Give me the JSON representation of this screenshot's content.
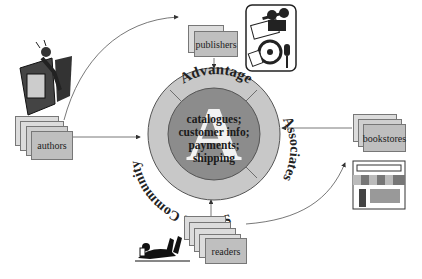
{
  "hub": {
    "outer_ring": {
      "top": "Advantage",
      "right": "Associates",
      "bottom_left": "Sales & Community"
    },
    "center_logo_letter": "A",
    "center_lines": [
      "catalogues;",
      "customer info;",
      "payments;",
      "shipping"
    ]
  },
  "nodes": {
    "publishers": {
      "label": "publishers",
      "icon": "film-projector-icon"
    },
    "authors": {
      "label": "authors",
      "icon": "writer-at-desk-icon"
    },
    "bookstores": {
      "label": "bookstores",
      "icon": "storefront-icon"
    },
    "readers": {
      "label": "readers",
      "icon": "reading-person-icon"
    }
  },
  "colors": {
    "ring": "#c8c8c8",
    "inner": "#8c8c8c",
    "card": "#bfbfbf",
    "card_light": "#dcdcdc",
    "stroke": "#555555"
  }
}
